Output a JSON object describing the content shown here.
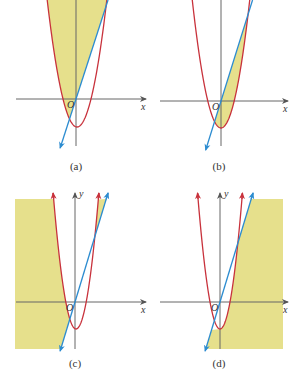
{
  "figure": {
    "colors": {
      "shade": "#E6E08C",
      "parabola": "#C8323C",
      "line": "#2C8CD0",
      "axis": "#666666",
      "text": "#333333"
    },
    "axis_labels": {
      "x": "x",
      "y": "y",
      "origin": "O"
    },
    "panels": [
      {
        "id": "a",
        "caption": "(a)",
        "origin": [
          76,
          99
        ],
        "vertex": [
          77,
          127
        ],
        "k": 0.143,
        "slope": 3.09,
        "xaxis": [
          16,
          146
        ],
        "yaxis": [
          0,
          146
        ],
        "line_bottom_y": 148,
        "top_y": 0,
        "shade": "inside-parabola-left-of-line",
        "caption_pos": [
          76,
          170
        ],
        "show_y_label": false
      },
      {
        "id": "b",
        "caption": "(b)",
        "origin": [
          221,
          101
        ],
        "vertex": [
          221,
          128
        ],
        "k": 0.155,
        "slope": 3.2,
        "xaxis": [
          160,
          288
        ],
        "yaxis": [
          0,
          146
        ],
        "line_bottom_y": 150,
        "top_y": 0,
        "shade": "inside-parabola-right-of-line",
        "caption_pos": [
          219,
          170
        ],
        "show_y_label": false
      },
      {
        "id": "c",
        "caption": "(c)",
        "origin": [
          75,
          302
        ],
        "vertex": [
          76,
          329
        ],
        "k": 0.26,
        "slope": 3.3,
        "xaxis": [
          16,
          146
        ],
        "yaxis": [
          191,
          349
        ],
        "line_bottom_y": 351,
        "top_y": 191,
        "shade": "outside-parabola-left-of-line",
        "shade_box": [
          15,
          199,
          146,
          349
        ],
        "caption_pos": [
          75,
          367
        ],
        "show_y_label": true
      },
      {
        "id": "d",
        "caption": "(d)",
        "origin": [
          220,
          302
        ],
        "vertex": [
          220,
          329
        ],
        "k": 0.27,
        "slope": 3.3,
        "xaxis": [
          160,
          288
        ],
        "yaxis": [
          191,
          349
        ],
        "line_bottom_y": 351,
        "top_y": 191,
        "shade": "outside-parabola-right-of-line",
        "shade_box": [
          152,
          199,
          283,
          349
        ],
        "caption_pos": [
          219,
          367
        ],
        "show_y_label": true
      }
    ]
  }
}
